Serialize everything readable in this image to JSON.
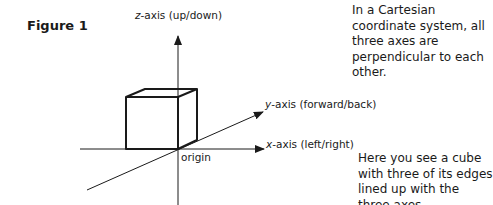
{
  "figure": {
    "label": "Figure 1"
  },
  "axes": {
    "z": {
      "var": "z",
      "suffix": "-axis (up/down)"
    },
    "y": {
      "var": "y",
      "suffix": "-axis (forward/back)"
    },
    "x": {
      "var": "x",
      "suffix": "-axis (left/right)"
    },
    "origin_label": "origin"
  },
  "notes": {
    "top": "In a Cartesian coordinate system, all three axes are perpendicular to each other.",
    "bottom": "Here you see a cube with three of its edges lined up with the three axes."
  },
  "colors": {
    "line": "#1a1a1a",
    "background": "#ffffff"
  }
}
